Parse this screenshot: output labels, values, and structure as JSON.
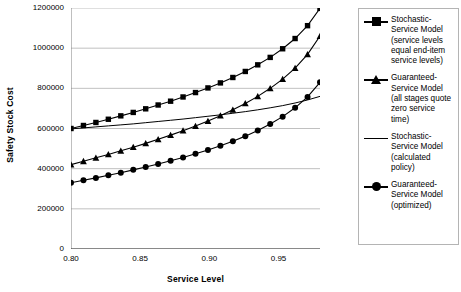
{
  "chart_data": {
    "type": "line",
    "title": "",
    "xlabel": "Service Level",
    "ylabel": "Safety Stock Cost",
    "xlim": [
      0.8,
      0.98
    ],
    "ylim": [
      0,
      1200000
    ],
    "grid": "horizontal",
    "legend_position": "right",
    "xticks": [
      "0.80",
      "0.85",
      "0.90",
      "0.95"
    ],
    "xtick_values": [
      0.8,
      0.85,
      0.9,
      0.95
    ],
    "yticks": [
      "0",
      "200000",
      "400000",
      "600000",
      "800000",
      "1000000",
      "1200000"
    ],
    "ytick_values": [
      0,
      200000,
      400000,
      600000,
      800000,
      1000000,
      1200000
    ],
    "x": [
      0.8,
      0.809,
      0.818,
      0.827,
      0.836,
      0.845,
      0.854,
      0.863,
      0.872,
      0.881,
      0.89,
      0.899,
      0.908,
      0.917,
      0.926,
      0.935,
      0.944,
      0.953,
      0.962,
      0.971,
      0.98
    ],
    "series": [
      {
        "name": "Stochastic-Service Model (service levels equal end-item service levels)",
        "marker": "square",
        "line": "solid",
        "values": [
          600000,
          615000,
          630000,
          646000,
          663000,
          680000,
          698000,
          717000,
          736000,
          757000,
          779000,
          802000,
          827000,
          854000,
          884000,
          917000,
          954000,
          997000,
          1048000,
          1112000,
          1198000
        ]
      },
      {
        "name": "Guaranteed-Service Model (all stages quote zero service time)",
        "marker": "triangle",
        "line": "solid",
        "values": [
          420000,
          437000,
          454000,
          471000,
          489000,
          507000,
          526000,
          546000,
          567000,
          589000,
          612000,
          637000,
          664000,
          693000,
          725000,
          760000,
          800000,
          846000,
          901000,
          969000,
          1060000
        ]
      },
      {
        "name": "Stochastic-Service Model (calculated policy)",
        "marker": "none",
        "line": "solid",
        "values": [
          598000,
          603000,
          608000,
          613000,
          618000,
          623000,
          629000,
          635000,
          641000,
          647000,
          654000,
          661000,
          668000,
          676000,
          684000,
          693000,
          703000,
          714000,
          727000,
          742000,
          760000
        ]
      },
      {
        "name": "Guaranteed-Service Model (optimized)",
        "marker": "circle",
        "line": "solid",
        "values": [
          330000,
          342000,
          354000,
          367000,
          380000,
          394000,
          408000,
          423000,
          439000,
          456000,
          474000,
          493000,
          514000,
          537000,
          562000,
          590000,
          622000,
          659000,
          703000,
          757000,
          830000
        ]
      }
    ]
  },
  "legend": {
    "entries": [
      {
        "marker": "square",
        "label": "Stochastic-Service Model (service levels equal end-item service levels)"
      },
      {
        "marker": "triangle",
        "label": "Guaranteed-Service Model (all stages quote zero service time)"
      },
      {
        "marker": "none",
        "label": "Stochastic-Service Model (calculated policy)"
      },
      {
        "marker": "circle",
        "label": "Guaranteed-Service Model (optimized)"
      }
    ]
  },
  "colors": {
    "series": "#000000",
    "grid": "#b0b0b0",
    "axis": "#808080",
    "background": "#ffffff",
    "legend_border": "#b4b4b4"
  }
}
